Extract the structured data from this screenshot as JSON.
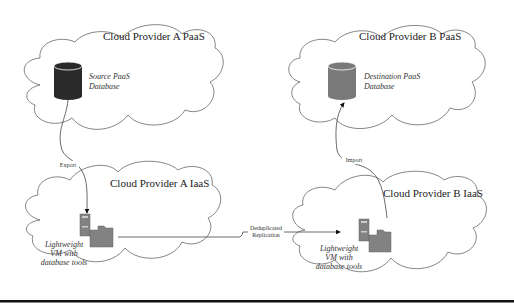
{
  "diagram": {
    "clouds": [
      {
        "id": "a-paas",
        "label": "Cloud Provider A PaaS"
      },
      {
        "id": "b-paas",
        "label": "Cloud Provider B PaaS"
      },
      {
        "id": "a-iaas",
        "label": "Cloud Provider A IaaS"
      },
      {
        "id": "b-iaas",
        "label": "Cloud Provider B IaaS"
      }
    ],
    "nodes": {
      "source_db": {
        "line1": "Source PaaS",
        "line2": "Database",
        "color": "#2a2a2a"
      },
      "dest_db": {
        "line1": "Destination PaaS",
        "line2": "Database",
        "color": "#7a7a7a"
      },
      "vm_a": {
        "line1": "Lightweight",
        "line2": "VM with",
        "line3": "database tools"
      },
      "vm_b": {
        "line1": "Lightweight",
        "line2": "VM with",
        "line3": "database tools"
      }
    },
    "edges": {
      "export": "Export",
      "import": "Import",
      "replication_line1": "Deduplicated",
      "replication_line2": "Replication"
    }
  }
}
